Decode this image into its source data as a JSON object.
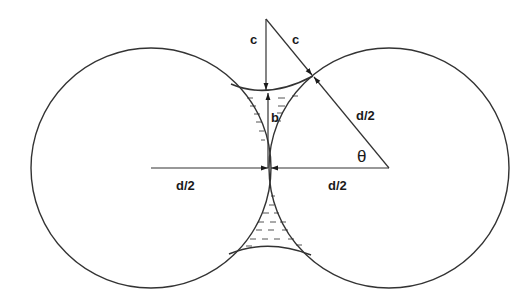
{
  "diagram": {
    "type": "geometry",
    "labels": {
      "c_vertical": "c",
      "c_diagonal": "c",
      "b": "b",
      "d2_diagonal": "d/2",
      "theta": "θ",
      "d2_left": "d/2",
      "d2_right": "d/2"
    },
    "colors": {
      "line": "#333333",
      "liquid_dash": "#555555",
      "background": "#ffffff"
    },
    "geometry": {
      "left_circle": {
        "cx": 151,
        "cy": 168,
        "r": 120
      },
      "right_circle": {
        "cx": 389,
        "cy": 168,
        "r": 120
      },
      "contact_point": [
        269,
        168
      ],
      "meniscus_center_top": [
        266,
        19
      ],
      "tangent_point": [
        313,
        76
      ]
    }
  }
}
